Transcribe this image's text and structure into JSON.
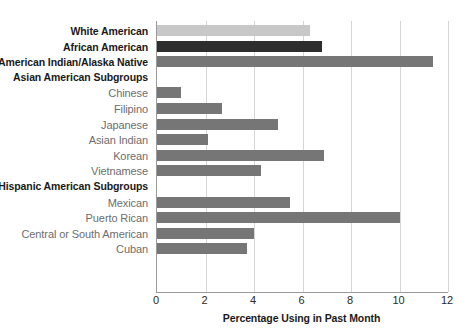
{
  "chart_data": {
    "type": "bar",
    "orientation": "horizontal",
    "title": "",
    "xlabel": "Percentage Using in Past Month",
    "ylabel": "",
    "xlim": [
      0,
      12
    ],
    "xticks": [
      0,
      2,
      4,
      6,
      8,
      10,
      12
    ],
    "grid": true,
    "legend": false,
    "categories": [
      "White American",
      "African American",
      "American Indian/Alaska Native",
      "Chinese",
      "Filipino",
      "Japanese",
      "Asian Indian",
      "Korean",
      "Vietnamese",
      "Mexican",
      "Puerto Rican",
      "Central or South American",
      "Cuban"
    ],
    "values": [
      6.3,
      6.8,
      11.4,
      1.0,
      2.7,
      5.0,
      2.1,
      6.9,
      4.3,
      5.5,
      10.0,
      4.0,
      3.7
    ],
    "group_headers": [
      "Asian American Subgroups",
      "Hispanic American Subgroups"
    ],
    "rows": [
      {
        "kind": "bar",
        "label": "White American",
        "value": 6.3,
        "style": "major",
        "color": "#c8c8c8"
      },
      {
        "kind": "bar",
        "label": "African American",
        "value": 6.8,
        "style": "major",
        "color": "#2d2d2d"
      },
      {
        "kind": "bar",
        "label": "American Indian/Alaska Native",
        "value": 11.4,
        "style": "major",
        "color": "#767676"
      },
      {
        "kind": "header",
        "label": "Asian American Subgroups",
        "value": null,
        "style": "header",
        "color": ""
      },
      {
        "kind": "bar",
        "label": "Chinese",
        "value": 1.0,
        "style": "sub",
        "color": "#767676"
      },
      {
        "kind": "bar",
        "label": "Filipino",
        "value": 2.7,
        "style": "sub",
        "color": "#767676"
      },
      {
        "kind": "bar",
        "label": "Japanese",
        "value": 5.0,
        "style": "sub",
        "color": "#767676"
      },
      {
        "kind": "bar",
        "label": "Asian Indian",
        "value": 2.1,
        "style": "sub",
        "color": "#767676"
      },
      {
        "kind": "bar",
        "label": "Korean",
        "value": 6.9,
        "style": "sub",
        "color": "#767676"
      },
      {
        "kind": "bar",
        "label": "Vietnamese",
        "value": 4.3,
        "style": "sub",
        "color": "#767676"
      },
      {
        "kind": "header",
        "label": "Hispanic American Subgroups",
        "value": null,
        "style": "header",
        "color": ""
      },
      {
        "kind": "bar",
        "label": "Mexican",
        "value": 5.5,
        "style": "sub",
        "color": "#767676"
      },
      {
        "kind": "bar",
        "label": "Puerto Rican",
        "value": 10.0,
        "style": "sub",
        "color": "#767676"
      },
      {
        "kind": "bar",
        "label": "Central or South American",
        "value": 4.0,
        "style": "sub",
        "color": "#767676"
      },
      {
        "kind": "bar",
        "label": "Cuban",
        "value": 3.7,
        "style": "sub",
        "color": "#767676"
      }
    ],
    "colors": {
      "white_american_bar": "#c8c8c8",
      "african_american_bar": "#2d2d2d",
      "default_bar": "#767676",
      "gridline": "#d5d5d5",
      "axis": "#9a9a9a",
      "major_label": "#1a1a1a",
      "sub_label": "#6e6e6e"
    }
  }
}
